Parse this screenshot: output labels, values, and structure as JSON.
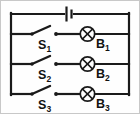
{
  "diagram": {
    "type": "circuit-schematic",
    "colors": {
      "wire": "#1a1a1a",
      "background": "#fefefe",
      "border": "#c8c8c8"
    },
    "battery": {
      "name": "battery-cell",
      "position": {
        "x": 68,
        "y": 13
      }
    },
    "branches": [
      {
        "switch_label": "S",
        "switch_sub": "1",
        "lamp_label": "B",
        "lamp_sub": "1",
        "y": 33,
        "switch_state": "open"
      },
      {
        "switch_label": "S",
        "switch_sub": "2",
        "lamp_label": "B",
        "lamp_sub": "2",
        "y": 63,
        "switch_state": "open"
      },
      {
        "switch_label": "S",
        "switch_sub": "3",
        "lamp_label": "B",
        "lamp_sub": "3",
        "y": 93,
        "switch_state": "open"
      }
    ],
    "rails": {
      "left_x": 10,
      "right_x": 128,
      "top_y": 13,
      "bottom_y": 93
    }
  }
}
